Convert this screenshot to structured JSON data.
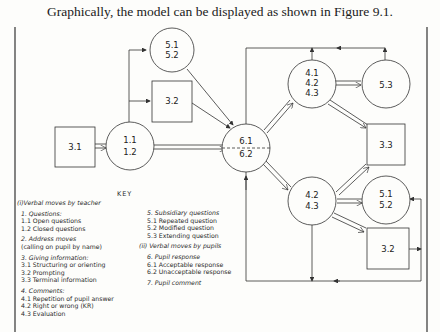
{
  "caption": "Graphically, the model can be displayed as shown in Figure 9.1.",
  "diagram": {
    "nodes": [
      {
        "id": "n31",
        "shape": "square",
        "lines": [
          "3.1"
        ]
      },
      {
        "id": "n11",
        "shape": "circle",
        "lines": [
          "1.1",
          "1.2"
        ]
      },
      {
        "id": "n51a",
        "shape": "circle",
        "lines": [
          "5.1",
          "5.2"
        ]
      },
      {
        "id": "n32a",
        "shape": "square",
        "lines": [
          "3.2"
        ]
      },
      {
        "id": "n61",
        "shape": "circle",
        "lines": [
          "6.1",
          "6.2"
        ]
      },
      {
        "id": "n41",
        "shape": "circle",
        "lines": [
          "4.1",
          "4.2",
          "4.3"
        ]
      },
      {
        "id": "n53",
        "shape": "circle",
        "lines": [
          "5.3"
        ]
      },
      {
        "id": "n33",
        "shape": "square",
        "lines": [
          "3.3"
        ]
      },
      {
        "id": "n42",
        "shape": "circle",
        "lines": [
          "4.2",
          "4.3"
        ]
      },
      {
        "id": "n51b",
        "shape": "circle",
        "lines": [
          "5.1",
          "5.2"
        ]
      },
      {
        "id": "n32b",
        "shape": "square",
        "lines": [
          "3.2"
        ]
      }
    ],
    "edges": [
      {
        "from": "3.1",
        "to": "1.1/1.2",
        "style": "double"
      },
      {
        "from": "1.1/1.2",
        "to": "5.1/5.2",
        "style": "single"
      },
      {
        "from": "1.1/1.2",
        "to": "3.2",
        "style": "single"
      },
      {
        "from": "1.1/1.2",
        "to": "6.1/6.2",
        "style": "double"
      },
      {
        "from": "5.1/5.2",
        "to": "6.1/6.2",
        "style": "single"
      },
      {
        "from": "3.2",
        "to": "6.1/6.2",
        "style": "single"
      },
      {
        "from": "6.1/6.2",
        "to": "4.1/4.2/4.3",
        "style": "double"
      },
      {
        "from": "6.1/6.2",
        "to": "4.2/4.3",
        "style": "double"
      },
      {
        "from": "4.1/4.2/4.3",
        "to": "5.3",
        "style": "double"
      },
      {
        "from": "4.1/4.2/4.3",
        "to": "3.3",
        "style": "double"
      },
      {
        "from": "4.2/4.3",
        "to": "3.3",
        "style": "double"
      },
      {
        "from": "4.2/4.3",
        "to": "5.1/5.2",
        "style": "double"
      },
      {
        "from": "4.2/4.3",
        "to": "3.2",
        "style": "double"
      },
      {
        "from": "top loop",
        "to": "6.1/6.2",
        "style": "single"
      },
      {
        "from": "bottom loop",
        "to": "6.1/6.2",
        "style": "single"
      }
    ]
  },
  "key": {
    "title": "KEY",
    "teacher_heading": "(i)Verbal moves by teacher",
    "groups_left": [
      {
        "heading": "1. Questions:",
        "items": [
          "1.1  Open questions",
          "1.2  Closed questions"
        ]
      },
      {
        "heading": "2. Address moves",
        "items": [
          "(calling on pupil by name)"
        ]
      },
      {
        "heading": "3. Giving information:",
        "items": [
          "3.1  Structuring or orienting",
          "3.2  Prompting",
          "3.3  Terminal information"
        ]
      },
      {
        "heading": "4. Comments:",
        "items": [
          "4.1  Repetition of pupil answer",
          "4.2  Right or wrong (KR)",
          "4.3  Evaluation"
        ]
      }
    ],
    "subsidiary": {
      "heading": "5. Subsidiary questions",
      "items": [
        "5.1  Repeated question",
        "5.2  Modified question",
        "5.3  Extending question"
      ]
    },
    "pupil_heading": "(ii) Verbal moves by pupils",
    "pupil_response": {
      "heading": "6. Pupil response",
      "items": [
        "6.1  Acceptable response",
        "6.2  Unacceptable response"
      ]
    },
    "pupil_comment": "7. Pupil comment"
  }
}
